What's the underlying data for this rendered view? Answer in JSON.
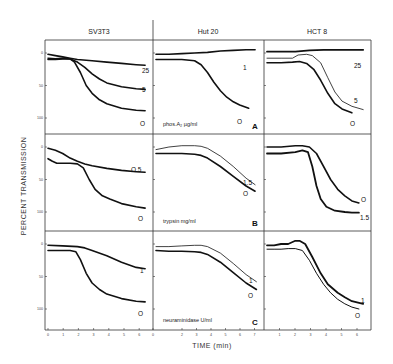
{
  "figure": {
    "y_axis_title": "PERCENT TRANSMISSION",
    "x_axis_title": "TIME (min)",
    "columns": [
      "SV3T3",
      "Hut 20",
      "HCT 8"
    ],
    "rows": [
      {
        "enzyme": "phos.A₂ µg/ml",
        "letter": "A"
      },
      {
        "enzyme": "trypsin mg/ml",
        "letter": "B"
      },
      {
        "enzyme": "neuraminidase U/ml",
        "letter": "C"
      }
    ],
    "y_ticks": [
      "0",
      "50",
      "100"
    ],
    "x_ticks": [
      [
        "0",
        "1",
        "2",
        "3",
        "4",
        "5",
        "6"
      ],
      [
        "0",
        "2",
        "3",
        "4",
        "5",
        "6",
        "7"
      ],
      [
        "1",
        "2",
        "3",
        "4",
        "5",
        "6"
      ]
    ]
  },
  "chart_data": [
    {
      "type": "line",
      "panel": "A",
      "cell_line": "SV3T3",
      "enzyme": "phos.A2 ug/ml",
      "xlabel": "TIME (min)",
      "ylabel": "PERCENT TRANSMISSION",
      "xlim": [
        0,
        6.8
      ],
      "ylim": [
        0,
        120
      ],
      "series": [
        {
          "name": "25",
          "width": 1.6,
          "x": [
            0,
            0.5,
            1,
            1.5,
            2,
            3,
            4,
            5,
            6,
            6.6
          ],
          "y": [
            2,
            4,
            6,
            8,
            10,
            12,
            14,
            16,
            18,
            19
          ]
        },
        {
          "name": "5",
          "width": 1.6,
          "x": [
            0,
            0.5,
            1,
            1.5,
            2,
            2.5,
            3,
            3.5,
            4,
            5,
            6,
            6.6
          ],
          "y": [
            10,
            10,
            9,
            9,
            14,
            22,
            32,
            40,
            46,
            52,
            55,
            56
          ]
        },
        {
          "name": "0",
          "width": 1.6,
          "x": [
            0,
            0.5,
            1,
            1.5,
            1.8,
            2.2,
            2.6,
            3,
            3.5,
            4,
            5,
            6,
            6.6
          ],
          "y": [
            8,
            9,
            8,
            9,
            14,
            30,
            50,
            62,
            72,
            78,
            85,
            88,
            89
          ]
        }
      ]
    },
    {
      "type": "line",
      "panel": "A",
      "cell_line": "Hut 20",
      "enzyme": "phos.A2 ug/ml",
      "xlabel": "TIME (min)",
      "ylabel": "PERCENT TRANSMISSION",
      "xlim": [
        0,
        8
      ],
      "ylim": [
        0,
        120
      ],
      "series": [
        {
          "name": "1",
          "width": 1.6,
          "x": [
            0,
            1,
            2,
            3,
            4,
            5,
            6,
            7,
            7.7
          ],
          "y": [
            2,
            2,
            1,
            0,
            -1,
            -3,
            -4,
            -5,
            -5
          ]
        },
        {
          "name": "0",
          "width": 1.6,
          "x": [
            0,
            1,
            2,
            3,
            3.5,
            4,
            4.5,
            5,
            5.5,
            6,
            6.5,
            7.2
          ],
          "y": [
            10,
            10,
            10,
            12,
            18,
            30,
            45,
            58,
            68,
            75,
            80,
            85
          ]
        }
      ]
    },
    {
      "type": "line",
      "panel": "A",
      "cell_line": "HCT 8",
      "enzyme": "phos.A2 ug/ml",
      "xlabel": "TIME (min)",
      "ylabel": "PERCENT TRANSMISSION",
      "xlim": [
        0,
        7
      ],
      "ylim": [
        0,
        120
      ],
      "series": [
        {
          "name": "25",
          "width": 1.8,
          "x": [
            0,
            1,
            2,
            3,
            4,
            5,
            6,
            6.8
          ],
          "y": [
            -2,
            -2,
            -2,
            -4,
            -5,
            -5,
            -5,
            -5
          ]
        },
        {
          "name": "5",
          "width": 0.8,
          "x": [
            0,
            1,
            1.8,
            2.2,
            2.8,
            3.2,
            3.8,
            4.3,
            4.8,
            5.3,
            6,
            6.8
          ],
          "y": [
            8,
            8,
            8,
            3,
            2,
            4,
            15,
            38,
            60,
            74,
            82,
            87
          ]
        },
        {
          "name": "0",
          "width": 1.6,
          "x": [
            0,
            1,
            1.8,
            2.3,
            2.8,
            3.3,
            3.8,
            4.3,
            4.8,
            5.3,
            6
          ],
          "y": [
            15,
            15,
            14,
            13,
            16,
            25,
            42,
            62,
            78,
            86,
            92
          ]
        }
      ]
    },
    {
      "type": "line",
      "panel": "B",
      "cell_line": "SV3T3",
      "enzyme": "trypsin mg/ml",
      "xlabel": "TIME (min)",
      "ylabel": "PERCENT TRANSMISSION",
      "xlim": [
        0,
        6.8
      ],
      "ylim": [
        0,
        120
      ],
      "series": [
        {
          "name": "0.5",
          "width": 1.6,
          "x": [
            0,
            0.5,
            1,
            1.5,
            2,
            2.5,
            3,
            4,
            5,
            6,
            6.6
          ],
          "y": [
            2,
            5,
            10,
            17,
            22,
            26,
            29,
            33,
            36,
            38,
            39
          ]
        },
        {
          "name": "0",
          "width": 1.6,
          "x": [
            0,
            0.3,
            0.6,
            1,
            1.5,
            2,
            2.4,
            2.8,
            3.2,
            3.7,
            4.2,
            5,
            6,
            6.6
          ],
          "y": [
            18,
            22,
            25,
            25,
            25,
            26,
            32,
            50,
            65,
            75,
            80,
            87,
            92,
            94
          ]
        }
      ]
    },
    {
      "type": "line",
      "panel": "B",
      "cell_line": "Hut 20",
      "enzyme": "trypsin mg/ml",
      "xlabel": "TIME (min)",
      "ylabel": "PERCENT TRANSMISSION",
      "xlim": [
        0,
        8
      ],
      "ylim": [
        0,
        120
      ],
      "series": [
        {
          "name": "1.5",
          "width": 0.8,
          "x": [
            0,
            1,
            2,
            3,
            3.5,
            4,
            5,
            6,
            7,
            7.7
          ],
          "y": [
            4,
            0,
            -2,
            -2,
            -1,
            2,
            14,
            30,
            48,
            58
          ]
        },
        {
          "name": "0",
          "width": 1.6,
          "x": [
            0,
            1,
            2,
            3,
            3.5,
            4,
            5,
            6,
            7,
            7.7
          ],
          "y": [
            10,
            10,
            10,
            11,
            13,
            17,
            30,
            45,
            60,
            68
          ]
        }
      ]
    },
    {
      "type": "line",
      "panel": "B",
      "cell_line": "HCT 8",
      "enzyme": "trypsin mg/ml",
      "xlabel": "TIME (min)",
      "ylabel": "PERCENT TRANSMISSION",
      "xlim": [
        0,
        7
      ],
      "ylim": [
        0,
        120
      ],
      "series": [
        {
          "name": "0",
          "width": 1.6,
          "x": [
            0,
            1,
            2,
            2.5,
            3,
            3.5,
            4,
            4.5,
            5,
            5.5,
            6,
            6.5
          ],
          "y": [
            0,
            0,
            -2,
            -2,
            0,
            10,
            30,
            50,
            65,
            75,
            83,
            86
          ]
        },
        {
          "name": "1.5",
          "width": 1.8,
          "x": [
            0,
            1,
            2,
            2.5,
            2.9,
            3.2,
            3.5,
            3.8,
            4.2,
            4.8,
            5.5,
            6,
            6.5
          ],
          "y": [
            10,
            10,
            8,
            5,
            8,
            30,
            60,
            80,
            92,
            98,
            100,
            101,
            101
          ]
        }
      ]
    },
    {
      "type": "line",
      "panel": "C",
      "cell_line": "SV3T3",
      "enzyme": "neuraminidase U/ml",
      "xlabel": "TIME (min)",
      "ylabel": "PERCENT TRANSMISSION",
      "xlim": [
        0,
        6.8
      ],
      "ylim": [
        0,
        120
      ],
      "series": [
        {
          "name": "1",
          "width": 1.6,
          "x": [
            0,
            1,
            2,
            2.5,
            3,
            4,
            5,
            6,
            6.6
          ],
          "y": [
            2,
            3,
            4,
            6,
            10,
            18,
            28,
            36,
            38
          ]
        },
        {
          "name": "0",
          "width": 1.6,
          "x": [
            0,
            0.5,
            1,
            1.5,
            1.9,
            2.2,
            2.6,
            3,
            3.5,
            4,
            5,
            6,
            6.6
          ],
          "y": [
            10,
            10,
            10,
            10,
            12,
            24,
            45,
            60,
            70,
            77,
            84,
            88,
            89
          ]
        }
      ]
    },
    {
      "type": "line",
      "panel": "C",
      "cell_line": "Hut 20",
      "enzyme": "neuraminidase U/ml",
      "xlabel": "TIME (min)",
      "ylabel": "PERCENT TRANSMISSION",
      "xlim": [
        0,
        8
      ],
      "ylim": [
        0,
        120
      ],
      "series": [
        {
          "name": "1",
          "width": 0.8,
          "x": [
            0,
            1,
            2,
            3,
            3.5,
            4,
            5,
            6,
            7,
            7.8
          ],
          "y": [
            4,
            4,
            3,
            2,
            2,
            4,
            14,
            30,
            47,
            58
          ]
        },
        {
          "name": "0",
          "width": 1.6,
          "x": [
            0,
            1,
            2,
            3,
            3.5,
            4,
            5,
            6,
            7,
            7.8
          ],
          "y": [
            10,
            11,
            11,
            12,
            13,
            16,
            28,
            44,
            60,
            70
          ]
        }
      ]
    },
    {
      "type": "line",
      "panel": "C",
      "cell_line": "HCT 8",
      "enzyme": "neuraminidase U/ml",
      "xlabel": "TIME (min)",
      "ylabel": "PERCENT TRANSMISSION",
      "xlim": [
        0,
        7
      ],
      "ylim": [
        0,
        120
      ],
      "series": [
        {
          "name": "1",
          "width": 1.8,
          "x": [
            0,
            0.5,
            1,
            1.5,
            2,
            2.3,
            2.7,
            3.2,
            3.8,
            4.3,
            5,
            5.5,
            6,
            6.8
          ],
          "y": [
            2,
            2,
            0,
            0,
            -5,
            -5,
            0,
            20,
            45,
            62,
            75,
            82,
            88,
            92
          ]
        },
        {
          "name": "0",
          "width": 1.0,
          "x": [
            0,
            0.5,
            1,
            1.5,
            2,
            2.5,
            3,
            3.5,
            4,
            4.5,
            5,
            5.5,
            6,
            6.5
          ],
          "y": [
            8,
            8,
            8,
            7,
            7,
            10,
            25,
            45,
            62,
            75,
            85,
            92,
            97,
            100
          ]
        }
      ]
    }
  ],
  "curve_labels": [
    [
      [
        {
          "text": "25",
          "dx": 97,
          "dy": 33
        },
        {
          "text": "5",
          "dx": 97,
          "dy": 52
        },
        {
          "text": "O",
          "dx": 95,
          "dy": 86
        }
      ],
      [
        {
          "text": "1",
          "dx": 90,
          "dy": 30
        },
        {
          "text": "O",
          "dx": 84,
          "dy": 84
        }
      ],
      [
        {
          "text": "25",
          "dx": 90,
          "dy": 28
        },
        {
          "text": "5",
          "dx": 90,
          "dy": 63
        },
        {
          "text": "O",
          "dx": 86,
          "dy": 86
        }
      ]
    ],
    [
      [
        {
          "text": "O.5",
          "dx": 86,
          "dy": 38
        },
        {
          "text": "O",
          "dx": 93,
          "dy": 87
        }
      ],
      [
        {
          "text": "1.5",
          "dx": 90,
          "dy": 51
        },
        {
          "text": "O",
          "dx": 90,
          "dy": 62
        }
      ],
      [
        {
          "text": "O",
          "dx": 97,
          "dy": 68
        },
        {
          "text": "1.5",
          "dx": 96,
          "dy": 86
        }
      ]
    ],
    [
      [
        {
          "text": "1",
          "dx": 95,
          "dy": 42
        },
        {
          "text": "O",
          "dx": 93,
          "dy": 85
        }
      ],
      [
        {
          "text": "1",
          "dx": 96,
          "dy": 52
        },
        {
          "text": "O",
          "dx": 95,
          "dy": 67
        }
      ],
      [
        {
          "text": "1",
          "dx": 97,
          "dy": 72
        },
        {
          "text": "O",
          "dx": 91,
          "dy": 87
        }
      ]
    ]
  ]
}
